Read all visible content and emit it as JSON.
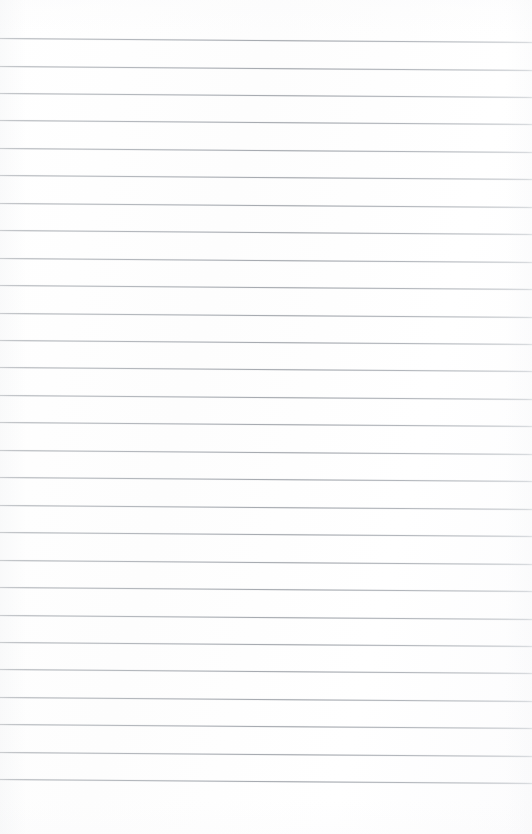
{
  "document": {
    "kind": "scanned-blank-ruled-paper",
    "page_width": 532,
    "page_height": 834,
    "background_color": "#fefefe",
    "paper_color": "#ffffff",
    "has_text": false,
    "has_margin_rule": false,
    "has_header": false,
    "has_page_number": false,
    "visible_text": ""
  },
  "ruling": {
    "line_count": 28,
    "line_color": "#b0b4b9",
    "line_thickness_px": 1,
    "line_spacing_px": 27.45,
    "first_line_y_left": 38,
    "last_line_y_left": 779,
    "left_x": 0,
    "right_x": 532,
    "slant_drop_px": 4,
    "top_margin_px": 38,
    "bottom_margin_px": 47,
    "style": "wide-ruled",
    "lines": [
      {
        "index": 1,
        "y_left": 38.0,
        "y_right": 42.0
      },
      {
        "index": 2,
        "y_left": 65.5,
        "y_right": 69.5
      },
      {
        "index": 3,
        "y_left": 92.9,
        "y_right": 96.9
      },
      {
        "index": 4,
        "y_left": 120.4,
        "y_right": 124.4
      },
      {
        "index": 5,
        "y_left": 147.8,
        "y_right": 151.8
      },
      {
        "index": 6,
        "y_left": 175.3,
        "y_right": 179.3
      },
      {
        "index": 7,
        "y_left": 202.7,
        "y_right": 206.7
      },
      {
        "index": 8,
        "y_left": 230.2,
        "y_right": 234.2
      },
      {
        "index": 9,
        "y_left": 257.6,
        "y_right": 261.6
      },
      {
        "index": 10,
        "y_left": 285.1,
        "y_right": 289.1
      },
      {
        "index": 11,
        "y_left": 312.5,
        "y_right": 316.5
      },
      {
        "index": 12,
        "y_left": 340.0,
        "y_right": 344.0
      },
      {
        "index": 13,
        "y_left": 367.4,
        "y_right": 371.4
      },
      {
        "index": 14,
        "y_left": 394.9,
        "y_right": 398.9
      },
      {
        "index": 15,
        "y_left": 422.3,
        "y_right": 426.3
      },
      {
        "index": 16,
        "y_left": 449.8,
        "y_right": 453.8
      },
      {
        "index": 17,
        "y_left": 477.2,
        "y_right": 481.2
      },
      {
        "index": 18,
        "y_left": 504.7,
        "y_right": 508.7
      },
      {
        "index": 19,
        "y_left": 532.1,
        "y_right": 536.1
      },
      {
        "index": 20,
        "y_left": 559.6,
        "y_right": 563.6
      },
      {
        "index": 21,
        "y_left": 587.0,
        "y_right": 591.0
      },
      {
        "index": 22,
        "y_left": 614.5,
        "y_right": 618.5
      },
      {
        "index": 23,
        "y_left": 641.9,
        "y_right": 645.9
      },
      {
        "index": 24,
        "y_left": 669.4,
        "y_right": 673.4
      },
      {
        "index": 25,
        "y_left": 696.8,
        "y_right": 700.8
      },
      {
        "index": 26,
        "y_left": 724.3,
        "y_right": 728.3
      },
      {
        "index": 27,
        "y_left": 751.7,
        "y_right": 755.7
      },
      {
        "index": 28,
        "y_left": 779.2,
        "y_right": 783.2
      }
    ]
  }
}
